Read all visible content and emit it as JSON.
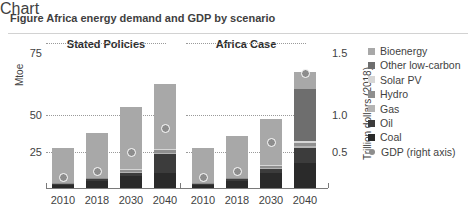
{
  "figure": {
    "clipped_title": "Figure  Africa energy demand and GDP by scenario"
  },
  "axes": {
    "left_title": "Mtoe",
    "right_title": "Trillion dollars (2018)",
    "left_ticks": [
      "75",
      "50",
      "25"
    ],
    "right_ticks": [
      "1.5",
      "1.0",
      "0.5"
    ]
  },
  "panels": [
    {
      "title": "Stated Policies"
    },
    {
      "title": "Africa Case"
    }
  ],
  "legend": {
    "items": [
      {
        "label": "Bioenergy",
        "color": "#a8a8a8",
        "marker": "square"
      },
      {
        "label": "Other low-carbon",
        "color": "#6e6e6e",
        "marker": "square"
      },
      {
        "label": "Solar PV",
        "color": "#d6d6d6",
        "marker": "square"
      },
      {
        "label": "Hydro",
        "color": "#8f8f8f",
        "marker": "square"
      },
      {
        "label": "Gas",
        "color": "#b4b4b4",
        "marker": "square"
      },
      {
        "label": "Oil",
        "color": "#3c3c3c",
        "marker": "square"
      },
      {
        "label": "Coal",
        "color": "#2a2a2a",
        "marker": "square"
      },
      {
        "label": "GDP (right axis)",
        "color": "#8d8d8d",
        "marker": "circle"
      }
    ]
  },
  "chart_data": {
    "type": "bar",
    "title": "Africa energy demand and GDP by scenario",
    "xlabel": "",
    "ylabel": "Mtoe",
    "y2label": "Trillion dollars (2018)",
    "ylim": [
      0,
      75
    ],
    "y2lim": [
      0,
      1.5
    ],
    "yticks": [
      25,
      50,
      75
    ],
    "y2ticks": [
      0.5,
      1.0,
      1.5
    ],
    "grid": "horizontal-dotted",
    "legend_position": "right",
    "stacked": true,
    "panels": [
      "Stated Policies",
      "Africa Case"
    ],
    "categories": [
      "2010",
      "2018",
      "2030",
      "2040"
    ],
    "series_order": [
      "Coal",
      "Oil",
      "Gas",
      "Hydro",
      "Solar PV",
      "Other low-carbon",
      "Bioenergy"
    ],
    "data": {
      "Stated Policies": {
        "Coal": [
          1.5,
          3.5,
          6.0,
          8.0
        ],
        "Oil": [
          0.5,
          1.0,
          2.0,
          9.5
        ],
        "Gas": [
          0.0,
          0.0,
          0.5,
          0.5
        ],
        "Hydro": [
          0.5,
          0.5,
          1.0,
          1.5
        ],
        "Solar PV": [
          0.0,
          0.0,
          0.5,
          0.5
        ],
        "Other low-carbon": [
          0.0,
          0.0,
          0.0,
          0.0
        ],
        "Bioenergy": [
          18.0,
          23.5,
          32.0,
          34.0
        ],
        "total": [
          20.5,
          28.5,
          42.0,
          54.0
        ]
      },
      "Africa Case": {
        "Coal": [
          1.5,
          3.5,
          7.5,
          13.0
        ],
        "Oil": [
          0.5,
          1.0,
          2.5,
          7.5
        ],
        "Gas": [
          0.0,
          0.0,
          0.5,
          1.0
        ],
        "Hydro": [
          0.5,
          0.5,
          1.0,
          2.0
        ],
        "Solar PV": [
          0.0,
          0.0,
          0.5,
          1.0
        ],
        "Other low-carbon": [
          0.0,
          0.0,
          0.0,
          26.5
        ],
        "Bioenergy": [
          18.0,
          22.0,
          23.5,
          9.0
        ],
        "total": [
          20.5,
          27.0,
          35.5,
          60.0
        ]
      }
    },
    "gdp_right_axis": {
      "Stated Policies": [
        0.11,
        0.17,
        0.37,
        0.62
      ],
      "Africa Case": [
        0.11,
        0.17,
        0.47,
        1.18
      ]
    }
  }
}
